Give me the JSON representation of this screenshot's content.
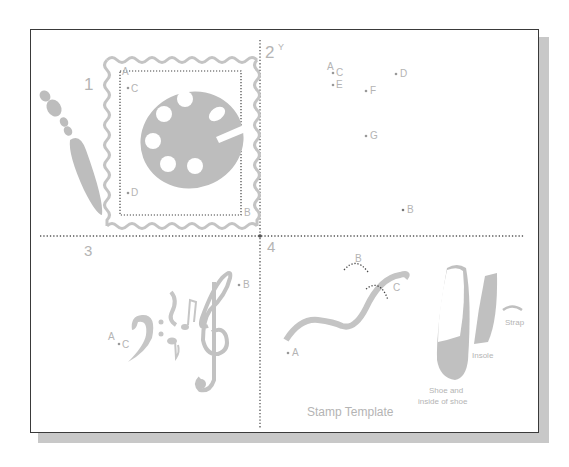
{
  "figure": {
    "colors": {
      "shape_fill": "#bdbdbd",
      "label_text": "#b4b4b4",
      "frame_border": "#3a3a3a",
      "shadow": "#c8c8c8",
      "dotted_line": "#555555"
    },
    "panels": [
      {
        "number": "1",
        "description": "Paint brush and palette inside postage stamp border",
        "points": [
          "A",
          "B",
          "C",
          "D"
        ]
      },
      {
        "number": "2",
        "axis_label": "Y",
        "points": [
          "A",
          "B",
          "C",
          "D",
          "E",
          "F",
          "G"
        ]
      },
      {
        "number": "3",
        "description": "Bass clef, notes and treble clef",
        "points": [
          "A",
          "B",
          "C"
        ]
      },
      {
        "number": "4",
        "description": "Curved path and ballet shoe parts",
        "points": [
          "A",
          "B",
          "C"
        ],
        "part_labels": {
          "strap": "Strap",
          "insole": "Insole",
          "shoe_line1": "Shoe and",
          "shoe_line2": "inside of shoe"
        },
        "caption": "Stamp Template"
      }
    ]
  }
}
